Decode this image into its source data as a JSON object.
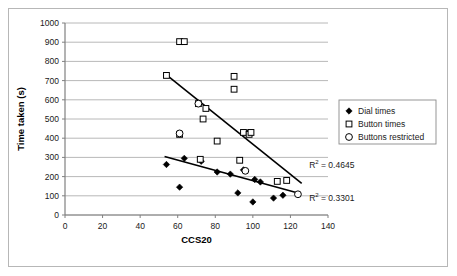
{
  "chart_data": {
    "type": "scatter",
    "title": "",
    "xlabel": "CCS20",
    "ylabel": "Time taken (s)",
    "xlim": [
      0,
      140
    ],
    "ylim": [
      0,
      1000
    ],
    "xticks": [
      0,
      20,
      40,
      60,
      80,
      100,
      120,
      140
    ],
    "yticks": [
      0,
      100,
      200,
      300,
      400,
      500,
      600,
      700,
      800,
      900,
      1000
    ],
    "grid": "horizontal",
    "legend_position": "right",
    "series": [
      {
        "name": "Dial times",
        "marker": "filled-diamond",
        "color": "#000000",
        "points": [
          [
            54,
            263
          ],
          [
            61,
            145
          ],
          [
            63.5,
            295
          ],
          [
            72.5,
            280
          ],
          [
            81,
            224
          ],
          [
            88,
            213
          ],
          [
            92,
            115
          ],
          [
            95,
            235
          ],
          [
            97.5,
            430
          ],
          [
            100,
            68
          ],
          [
            101,
            185
          ],
          [
            104,
            172
          ],
          [
            111,
            88
          ],
          [
            116,
            103
          ]
        ]
      },
      {
        "name": "Button times",
        "marker": "open-square",
        "color": "#000000",
        "points": [
          [
            54,
            727
          ],
          [
            61,
            903
          ],
          [
            63.5,
            903
          ],
          [
            61,
            420
          ],
          [
            71,
            580
          ],
          [
            75,
            555
          ],
          [
            73.5,
            500
          ],
          [
            81,
            385
          ],
          [
            72,
            290
          ],
          [
            90,
            722
          ],
          [
            90,
            655
          ],
          [
            95,
            430
          ],
          [
            93,
            285
          ],
          [
            98,
            420
          ],
          [
            99,
            430
          ],
          [
            113,
            175
          ],
          [
            118,
            180
          ]
        ]
      },
      {
        "name": "Buttons restricted",
        "marker": "open-circle",
        "color": "#000000",
        "points": [
          [
            71,
            580
          ],
          [
            61,
            425
          ],
          [
            96,
            230
          ],
          [
            124,
            108
          ]
        ]
      }
    ],
    "trendlines": [
      {
        "name": "Button times trend",
        "x0": 54,
        "y0": 730,
        "x1": 126,
        "y1": 165
      },
      {
        "name": "Dial times trend",
        "x0": 53,
        "y0": 305,
        "x1": 125,
        "y1": 112
      }
    ],
    "annotations": [
      {
        "name": "r-squared-button-times",
        "base": "R",
        "sup": "2",
        "value": " = 0.4645",
        "x": 130,
        "y": 245
      },
      {
        "name": "r-squared-dial-times",
        "base": "R",
        "sup": "2",
        "value": " = 0.3301",
        "x": 130,
        "y": 75
      }
    ]
  },
  "legend": {
    "items": [
      {
        "label": "Dial times",
        "marker": "filled-diamond"
      },
      {
        "label": "Button times",
        "marker": "open-square"
      },
      {
        "label": "Buttons restricted",
        "marker": "open-circle"
      }
    ]
  },
  "axes": {
    "x_title": "CCS20",
    "y_title": "Time taken (s)",
    "x_tick_labels": [
      "0",
      "20",
      "40",
      "60",
      "80",
      "100",
      "120",
      "140"
    ],
    "y_tick_labels": [
      "0",
      "100",
      "200",
      "300",
      "400",
      "500",
      "600",
      "700",
      "800",
      "900",
      "1000"
    ]
  },
  "colors": {
    "marker": "#000000",
    "trendline": "#000000",
    "grid": "#a6a6a6",
    "axis": "#808080",
    "frame": "#b7b7b7",
    "text": "#1a1a1a"
  }
}
